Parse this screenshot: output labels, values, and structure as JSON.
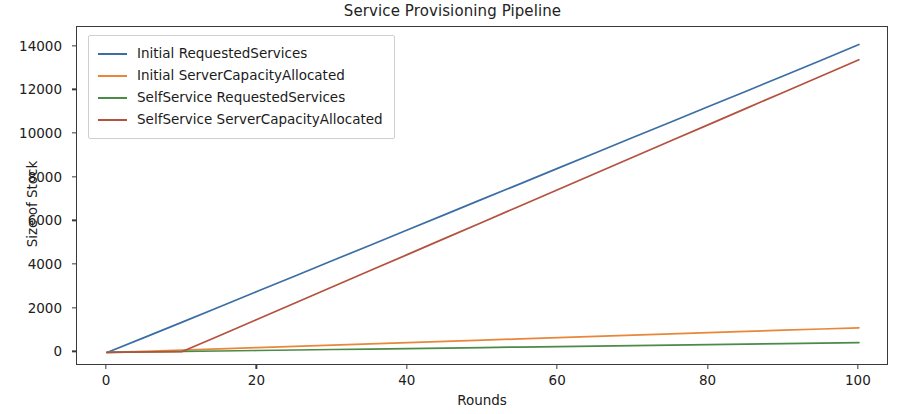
{
  "chart_data": {
    "type": "line",
    "title": "Service Provisioning Pipeline",
    "xlabel": "Rounds",
    "ylabel": "Size of Stock",
    "xlim": [
      -4,
      104
    ],
    "ylim": [
      -620,
      14900
    ],
    "grid": false,
    "legend_position": "upper left",
    "xticks": [
      0,
      20,
      40,
      60,
      80,
      100
    ],
    "xtick_labels": [
      "0",
      "20",
      "40",
      "60",
      "80",
      "100"
    ],
    "yticks": [
      0,
      2000,
      4000,
      6000,
      8000,
      10000,
      12000,
      14000
    ],
    "ytick_labels": [
      "0",
      "2000",
      "4000",
      "6000",
      "8000",
      "10000",
      "12000",
      "14000"
    ],
    "x": [
      0,
      5,
      10,
      15,
      20,
      25,
      30,
      35,
      40,
      45,
      50,
      55,
      60,
      65,
      70,
      75,
      80,
      85,
      90,
      95,
      100
    ],
    "series": [
      {
        "name": "Initial RequestedServices",
        "color": "#3a6ea5",
        "values": [
          0,
          690,
          1390,
          2090,
          2800,
          3500,
          4210,
          4910,
          5620,
          6320,
          7030,
          7730,
          8440,
          9140,
          9850,
          10550,
          11260,
          11960,
          12670,
          13380,
          14100
        ]
      },
      {
        "name": "Initial ServerCapacityAllocated",
        "color": "#e8873a",
        "values": [
          0,
          55,
          112,
          168,
          225,
          282,
          338,
          395,
          452,
          508,
          565,
          622,
          678,
          735,
          792,
          848,
          905,
          962,
          1018,
          1075,
          1130
        ]
      },
      {
        "name": "SelfService RequestedServices",
        "color": "#4b8b45",
        "values": [
          0,
          22,
          45,
          67,
          90,
          112,
          135,
          157,
          180,
          202,
          225,
          247,
          270,
          292,
          315,
          337,
          360,
          382,
          405,
          427,
          450
        ]
      },
      {
        "name": "SelfService ServerCapacityAllocated",
        "color": "#b4513f",
        "values": [
          0,
          20,
          40,
          780,
          1520,
          2265,
          3005,
          3750,
          4490,
          5235,
          5975,
          6720,
          7460,
          8205,
          8945,
          9690,
          10430,
          11175,
          11915,
          12660,
          13400
        ]
      }
    ]
  }
}
